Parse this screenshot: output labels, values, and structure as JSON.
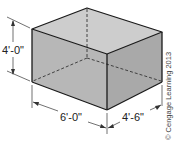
{
  "figure": {
    "type": "isometric rectangular box with hidden edges",
    "colors": {
      "top_face": "#cdcdcd",
      "front_face": "#b7b7b7",
      "right_face": "#a9a9a9",
      "edge": "#1a1a1a",
      "dimension": "#333333"
    },
    "dimensions": {
      "height": "4'-0\"",
      "length": "6'-0\"",
      "width": "4'-6\""
    },
    "copyright": "© Cengage Learning 2013"
  }
}
